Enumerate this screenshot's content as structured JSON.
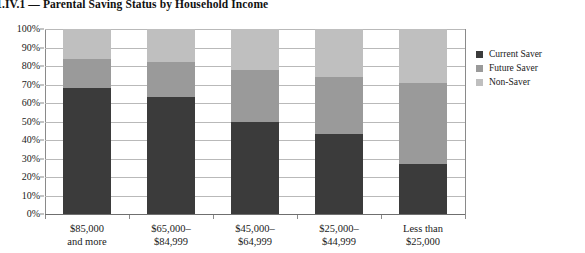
{
  "title": "e 1.IV.1 — Parental Saving Status by Household Income",
  "legend": {
    "position": "right",
    "items": [
      {
        "label": "Current Saver",
        "color": "#3b3b3b"
      },
      {
        "label": "Future Saver",
        "color": "#9a9a9a"
      },
      {
        "label": "Non-Saver",
        "color": "#bfbfbf"
      }
    ]
  },
  "y_axis": {
    "ticks": [
      "100%",
      "90%",
      "80%",
      "70%",
      "60%",
      "50%",
      "40%",
      "30%",
      "20%",
      "10%",
      "0%"
    ]
  },
  "x_axis": {
    "labels": [
      {
        "line1": "$85,000",
        "line2": "and more"
      },
      {
        "line1": "$65,000–",
        "line2": "$84,999"
      },
      {
        "line1": "$45,000–",
        "line2": "$64,999"
      },
      {
        "line1": "$25,000–",
        "line2": "$44,999"
      },
      {
        "line1": "Less than",
        "line2": "$25,000"
      }
    ]
  },
  "chart_data": {
    "type": "bar",
    "subtype": "stacked-100-percent",
    "title": "e 1.IV.1 — Parental Saving Status by Household Income",
    "xlabel": "",
    "ylabel": "",
    "ylim": [
      0,
      100
    ],
    "ytick_values": [
      0,
      10,
      20,
      30,
      40,
      50,
      60,
      70,
      80,
      90,
      100
    ],
    "ytick_labels": [
      "0%",
      "10%",
      "20%",
      "30%",
      "40%",
      "50%",
      "60%",
      "70%",
      "80%",
      "90%",
      "100%"
    ],
    "grid": true,
    "legend_position": "right",
    "categories": [
      "$85,000 and more",
      "$65,000–$84,999",
      "$45,000–$64,999",
      "$25,000–$44,999",
      "Less than $25,000"
    ],
    "series": [
      {
        "name": "Current Saver",
        "color": "#3b3b3b",
        "values": [
          68,
          63,
          50,
          43,
          27
        ]
      },
      {
        "name": "Future Saver",
        "color": "#9a9a9a",
        "values": [
          16,
          19,
          28,
          31,
          44
        ]
      },
      {
        "name": "Non-Saver",
        "color": "#bfbfbf",
        "values": [
          16,
          18,
          22,
          26,
          29
        ]
      }
    ]
  }
}
